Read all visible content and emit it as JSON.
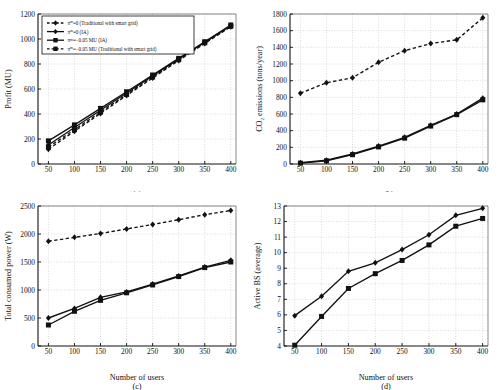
{
  "figure": {
    "name": "four-panel-line-chart",
    "panels": [
      "a",
      "b",
      "c",
      "d"
    ],
    "shared_xlabel": "Number of users"
  },
  "labels": {
    "panel_a": "(a)",
    "panel_b": "(b)",
    "panel_c": "(c)",
    "panel_d": "(d)"
  },
  "legend": {
    "title": "",
    "items": [
      {
        "label": "π",
        "sup": "m",
        "rest": "=0 (Traditional with smart grid)",
        "full": "πm=0 (Traditional with smart grid)",
        "style": "dashed",
        "marker": "diamond"
      },
      {
        "label": "π",
        "sup": "m",
        "rest": "=0 (IA)",
        "full": "πm=0 (IA)",
        "style": "solid",
        "marker": "diamond"
      },
      {
        "label": "π",
        "sup": "m",
        "rest": "=−0.05 MU (IA)",
        "full": "πm=-0.05 MU (IA)",
        "style": "solid",
        "marker": "square"
      },
      {
        "label": "π",
        "sup": "m",
        "rest": "=−0.05 MU (Traditional with smart grid)",
        "full": "πm=-0.05 MU (Traditional with smart grid)",
        "style": "dashed",
        "marker": "square"
      }
    ]
  },
  "colors": {
    "line": "#111111",
    "grid": "#b8b8b8",
    "axis": "#111111",
    "background": "#ffffff"
  },
  "chart_data": [
    {
      "type": "line",
      "panel": "a",
      "title": "",
      "xlabel": "",
      "ylabel": "Profit (MU)",
      "x": [
        50,
        100,
        150,
        200,
        250,
        300,
        350,
        400
      ],
      "xlim": [
        30,
        410
      ],
      "ylim": [
        0,
        1200
      ],
      "xticks": [
        50,
        100,
        150,
        200,
        250,
        300,
        350,
        400
      ],
      "yticks": [
        0,
        200,
        400,
        600,
        800,
        1000,
        1200
      ],
      "grid": true,
      "legend_position": "upper-left",
      "series": [
        {
          "name": "πm=0 (Traditional with smart grid)",
          "style": "dashed",
          "marker": "diamond",
          "values": [
            118,
            262,
            405,
            548,
            688,
            828,
            965,
            1098
          ]
        },
        {
          "name": "πm=0 (IA)",
          "style": "solid",
          "marker": "diamond",
          "values": [
            152,
            292,
            430,
            568,
            705,
            840,
            975,
            1108
          ]
        },
        {
          "name": "πm=−0.05 MU (IA)",
          "style": "solid",
          "marker": "square",
          "values": [
            185,
            313,
            445,
            578,
            712,
            845,
            978,
            1112
          ]
        },
        {
          "name": "πm=−0.05 MU (Traditional with smart grid)",
          "style": "dashed",
          "marker": "square",
          "values": [
            135,
            275,
            415,
            556,
            696,
            834,
            970,
            1102
          ]
        }
      ]
    },
    {
      "type": "line",
      "panel": "b",
      "title": "",
      "xlabel": "",
      "ylabel": "CO2 emissions (tons/year)",
      "ylabel_parts": {
        "pre": "CO",
        "sub": "2",
        "post": " emissions (tons/year)"
      },
      "x": [
        50,
        100,
        150,
        200,
        250,
        300,
        350,
        400
      ],
      "xlim": [
        30,
        410
      ],
      "ylim": [
        0,
        1800
      ],
      "xticks": [
        50,
        100,
        150,
        200,
        250,
        300,
        350,
        400
      ],
      "yticks": [
        0,
        200,
        400,
        600,
        800,
        1000,
        1200,
        1400,
        1600,
        1800
      ],
      "grid": true,
      "series": [
        {
          "name": "Traditional with smart grid",
          "style": "dashed",
          "marker": "diamond",
          "values": [
            850,
            975,
            1035,
            1220,
            1360,
            1445,
            1490,
            1755
          ]
        },
        {
          "name": "IA (diamond)",
          "style": "solid",
          "marker": "diamond",
          "values": [
            15,
            45,
            120,
            215,
            320,
            465,
            600,
            790
          ]
        },
        {
          "name": "IA (square)",
          "style": "solid",
          "marker": "square",
          "values": [
            10,
            38,
            112,
            205,
            310,
            455,
            592,
            770
          ]
        }
      ]
    },
    {
      "type": "line",
      "panel": "c",
      "title": "",
      "xlabel": "Number of users",
      "ylabel": "Total consumed power (W)",
      "x": [
        50,
        100,
        150,
        200,
        250,
        300,
        350,
        400
      ],
      "xlim": [
        30,
        410
      ],
      "ylim": [
        0,
        2500
      ],
      "xticks": [
        50,
        100,
        150,
        200,
        250,
        300,
        350,
        400
      ],
      "yticks": [
        0,
        500,
        1000,
        1500,
        2000,
        2500
      ],
      "grid": true,
      "series": [
        {
          "name": "Traditional with smart grid",
          "style": "dashed",
          "marker": "diamond",
          "values": [
            1870,
            1940,
            2010,
            2090,
            2170,
            2255,
            2345,
            2420
          ]
        },
        {
          "name": "IA (diamond)",
          "style": "solid",
          "marker": "diamond",
          "values": [
            500,
            670,
            870,
            965,
            1105,
            1250,
            1410,
            1530
          ]
        },
        {
          "name": "IA (square)",
          "style": "solid",
          "marker": "square",
          "values": [
            375,
            620,
            815,
            950,
            1090,
            1240,
            1400,
            1500
          ]
        }
      ]
    },
    {
      "type": "line",
      "panel": "d",
      "title": "",
      "xlabel": "Number of users",
      "ylabel": "Active BS (average)",
      "x": [
        50,
        100,
        150,
        200,
        250,
        300,
        350,
        400
      ],
      "xlim": [
        30,
        410
      ],
      "ylim": [
        4,
        13
      ],
      "xticks": [
        50,
        100,
        150,
        200,
        250,
        300,
        350,
        400
      ],
      "yticks": [
        4,
        5,
        6,
        7,
        8,
        9,
        10,
        11,
        12,
        13
      ],
      "grid": true,
      "series": [
        {
          "name": "IA (diamond)",
          "style": "solid",
          "marker": "diamond",
          "values": [
            5.95,
            7.2,
            8.8,
            9.35,
            10.2,
            11.15,
            12.4,
            12.85
          ]
        },
        {
          "name": "IA (square)",
          "style": "solid",
          "marker": "square",
          "values": [
            4.05,
            5.9,
            7.7,
            8.65,
            9.5,
            10.5,
            11.7,
            12.2
          ]
        }
      ]
    }
  ]
}
